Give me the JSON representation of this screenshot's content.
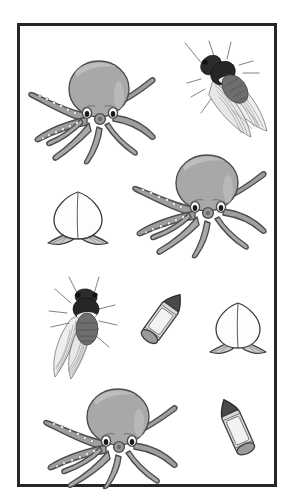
{
  "canvas": {
    "width": 293,
    "height": 495,
    "background_color": "#ffffff",
    "title": "Illustrated object panel"
  },
  "frame": {
    "name": "picture-frame",
    "border_color": "#262626",
    "border_width": 3,
    "fill_color": "#ffffff",
    "x": 17,
    "y": 23,
    "width": 260,
    "height": 464
  },
  "palette": {
    "octopus_body": "#a8a8a8",
    "octopus_body_light": "#bdbdbd",
    "octopus_outline": "#4d4d4d",
    "octopus_eye_white": "#ffffff",
    "octopus_pupil": "#1a1a1a",
    "cicada_thorax": "#2b2b2b",
    "cicada_abdomen": "#6e6e6e",
    "cicada_wing": "#ededed",
    "cicada_vein": "#555555",
    "peach_fill": "#fdfdfd",
    "peach_outline": "#3d3d3d",
    "peach_leaf": "#c9c9c9",
    "crayon_tip": "#4a4a4a",
    "crayon_body": "#d8d8d8",
    "crayon_band": "#f2f2f2",
    "crayon_outline": "#3a3a3a"
  },
  "objects": [
    {
      "id": "octopus-1",
      "kind": "octopus",
      "label": "Octopus",
      "x": 22,
      "y": 48,
      "width": 132,
      "height": 112,
      "rotation": 0
    },
    {
      "id": "cicada-1",
      "kind": "cicada",
      "label": "Cicada",
      "x": 176,
      "y": 36,
      "width": 94,
      "height": 100,
      "rotation": 0
    },
    {
      "id": "peach-1",
      "kind": "peach",
      "label": "Peach",
      "x": 41,
      "y": 183,
      "width": 68,
      "height": 62,
      "rotation": 0
    },
    {
      "id": "octopus-2",
      "kind": "octopus",
      "label": "Octopus",
      "x": 124,
      "y": 142,
      "width": 142,
      "height": 112,
      "rotation": 0
    },
    {
      "id": "cicada-2",
      "kind": "cicada",
      "label": "Cicada",
      "x": 38,
      "y": 272,
      "width": 86,
      "height": 106,
      "rotation": 0
    },
    {
      "id": "crayon-1",
      "kind": "crayon",
      "label": "Crayon",
      "x": 134,
      "y": 283,
      "width": 52,
      "height": 64,
      "rotation": 0
    },
    {
      "id": "peach-2",
      "kind": "peach",
      "label": "Peach",
      "x": 203,
      "y": 295,
      "width": 64,
      "height": 58,
      "rotation": 0
    },
    {
      "id": "octopus-3",
      "kind": "octopus",
      "label": "Octopus",
      "x": 35,
      "y": 378,
      "width": 142,
      "height": 100,
      "rotation": 0
    },
    {
      "id": "crayon-2",
      "kind": "crayon",
      "label": "Crayon",
      "x": 207,
      "y": 390,
      "width": 52,
      "height": 68,
      "rotation": 180
    }
  ],
  "counts": {
    "octopus": 3,
    "cicada": 2,
    "peach": 2,
    "crayon": 2,
    "total": 9
  }
}
